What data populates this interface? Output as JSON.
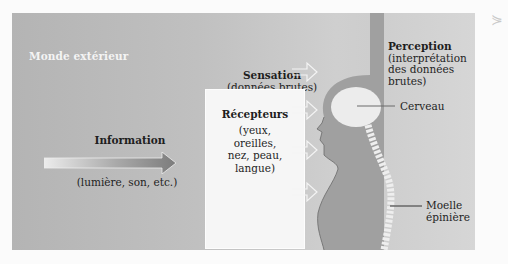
{
  "diagram": {
    "title": "Monde extérieur",
    "information": {
      "label": "Information",
      "subtitle": "(lumière, son, etc.)"
    },
    "sensation": {
      "title": "Sensation",
      "subtitle": "(données brutes)"
    },
    "receptors": {
      "title": "Récepteurs",
      "lines": [
        "(yeux,",
        "oreilles,",
        "nez, peau,",
        "langue)"
      ]
    },
    "perception": {
      "title": "Perception",
      "lines": [
        "(interprétation",
        "des données",
        "brutes)"
      ]
    },
    "labels": {
      "brain": "Cerveau",
      "spinal_cord_line1": "Moelle",
      "spinal_cord_line2": "épinière"
    },
    "corner_mark": "⋟",
    "colors": {
      "background": "#fbfbfb",
      "frame": "#bdbdbd",
      "body": "#9d9d9d",
      "receptor_box": "#f6f6f6",
      "text": "#1e1e1e",
      "title_text": "#f4f4f4"
    }
  }
}
